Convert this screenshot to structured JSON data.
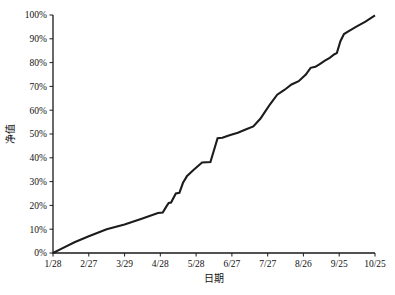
{
  "chart_data": {
    "type": "line",
    "title": "",
    "xlabel": "日期",
    "ylabel": "净值",
    "grid": false,
    "legend": false,
    "ylim": [
      0,
      100
    ],
    "y_unit": "%",
    "yticks": [
      0,
      10,
      20,
      30,
      40,
      50,
      60,
      70,
      80,
      90,
      100
    ],
    "ytick_labels": [
      "0%",
      "10%",
      "20%",
      "30%",
      "40%",
      "50%",
      "60%",
      "70%",
      "80%",
      "90%",
      "100%"
    ],
    "xtick_labels": [
      "1/28",
      "2/27",
      "3/29",
      "4/28",
      "5/28",
      "6/27",
      "7/27",
      "8/26",
      "9/25",
      "10/25"
    ],
    "x_index_of_ticks": [
      0,
      30,
      60,
      90,
      120,
      150,
      180,
      210,
      240,
      270
    ],
    "series": [
      {
        "name": "净值",
        "color": "#1c1c1c",
        "x": [
          0,
          6,
          18,
          30,
          45,
          60,
          75,
          88,
          92,
          95,
          97,
          99,
          103,
          106,
          109,
          112,
          112,
          118,
          125,
          132,
          138,
          142,
          148,
          155,
          162,
          168,
          174,
          178,
          182,
          188,
          194,
          200,
          206,
          212,
          216,
          220,
          224,
          228,
          232,
          236,
          238,
          241,
          244,
          248,
          254,
          262,
          270
        ],
        "y": [
          0,
          1.5,
          4.5,
          7.0,
          10.0,
          12.0,
          14.5,
          16.8,
          17.0,
          19.5,
          21.0,
          21.2,
          25.0,
          25.3,
          29.5,
          32.0,
          32.2,
          35.0,
          38.0,
          38.2,
          48.2,
          48.4,
          49.5,
          50.5,
          52.0,
          53.2,
          56.5,
          59.5,
          62.5,
          66.5,
          68.5,
          70.8,
          72.2,
          75.0,
          77.8,
          78.2,
          79.5,
          80.8,
          82.0,
          83.5,
          84.0,
          89.0,
          92.0,
          93.2,
          95.0,
          97.2,
          99.8
        ]
      }
    ],
    "annotations": []
  }
}
